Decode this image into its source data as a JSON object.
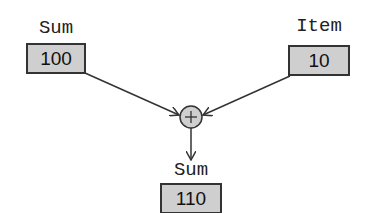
{
  "diagram": {
    "type": "data-flow",
    "nodes": {
      "sum_input": {
        "label": "Sum",
        "value": "100"
      },
      "item_input": {
        "label": "Item",
        "value": "10"
      },
      "adder": {
        "symbol": "+"
      },
      "sum_output": {
        "label": "Sum",
        "value": "110"
      }
    },
    "edges": [
      {
        "from": "sum_input",
        "to": "adder"
      },
      {
        "from": "item_input",
        "to": "adder"
      },
      {
        "from": "adder",
        "to": "sum_output"
      }
    ],
    "colors": {
      "box_fill": "#cfcfcf",
      "circle_fill": "#cfcfcf",
      "stroke": "#333333"
    }
  }
}
